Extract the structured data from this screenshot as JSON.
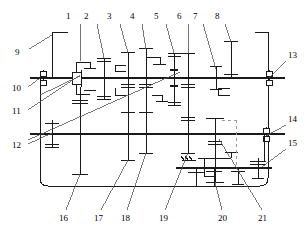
{
  "diagram": {
    "type": "mechanical-kinematic-schematic",
    "background": "#ffffff",
    "line_color": "#1a1a1a",
    "dashed_color": "#9a9a9a"
  },
  "labels": {
    "top": [
      {
        "id": "1",
        "x": 69,
        "y": 17,
        "lx": 80,
        "ly": 24,
        "ex": 80,
        "ey": 61
      },
      {
        "id": "2",
        "x": 87,
        "y": 17,
        "lx": 97,
        "ly": 24,
        "ex": 104,
        "ey": 58
      },
      {
        "id": "3",
        "x": 110,
        "y": 17,
        "lx": 120,
        "ly": 24,
        "ex": 128,
        "ey": 53
      },
      {
        "id": "4",
        "x": 133,
        "y": 17,
        "lx": 142,
        "ly": 24,
        "ex": 146,
        "ey": 49
      },
      {
        "id": "5",
        "x": 157,
        "y": 17,
        "lx": 166,
        "ly": 24,
        "ex": 174,
        "ey": 53
      },
      {
        "id": "6",
        "x": 180,
        "y": 17,
        "lx": 188,
        "ly": 24,
        "ex": 188,
        "ey": 53
      },
      {
        "id": "7",
        "x": 196,
        "y": 17,
        "lx": 203,
        "ly": 24,
        "ex": 216,
        "ey": 69
      },
      {
        "id": "8",
        "x": 218,
        "y": 17,
        "lx": 225,
        "ly": 24,
        "ex": 231,
        "ey": 42
      }
    ],
    "left": [
      {
        "id": "9",
        "x": 18,
        "y": 52,
        "lx": 29,
        "ly": 49,
        "ex": 52,
        "ey": 32
      },
      {
        "id": "10",
        "x": 16,
        "y": 90,
        "lx": 28,
        "ly": 87,
        "ex": 40,
        "ey": 78
      },
      {
        "id": "11",
        "x": 16,
        "y": 113,
        "lx": 28,
        "ly": 110,
        "ex": 76,
        "ey": 75
      },
      {
        "id": "12",
        "x": 16,
        "y": 147,
        "lx": 28,
        "ly": 144,
        "ex": 52,
        "ey": 133
      }
    ],
    "right": [
      {
        "id": "13",
        "x": 288,
        "y": 57,
        "lx": 286,
        "ly": 61,
        "ex": 269,
        "ey": 78
      },
      {
        "id": "14",
        "x": 288,
        "y": 121,
        "lx": 286,
        "ly": 125,
        "ex": 266,
        "ey": 136
      },
      {
        "id": "15",
        "x": 288,
        "y": 145,
        "lx": 286,
        "ly": 149,
        "ex": 262,
        "ey": 167
      }
    ],
    "bottom": [
      {
        "id": "16",
        "x": 62,
        "y": 218,
        "lx": 66,
        "ly": 210,
        "ex": 80,
        "ey": 174
      },
      {
        "id": "17",
        "x": 97,
        "y": 218,
        "lx": 101,
        "ly": 210,
        "ex": 128,
        "ey": 160
      },
      {
        "id": "18",
        "x": 124,
        "y": 218,
        "lx": 127,
        "ly": 210,
        "ex": 146,
        "ey": 153
      },
      {
        "id": "19",
        "x": 162,
        "y": 218,
        "lx": 165,
        "ly": 210,
        "ex": 188,
        "ey": 153
      },
      {
        "id": "20",
        "x": 222,
        "y": 218,
        "lx": 222,
        "ly": 210,
        "ex": 215,
        "ey": 182
      },
      {
        "id": "21",
        "x": 262,
        "y": 218,
        "lx": 262,
        "ly": 210,
        "ex": 219,
        "ey": 139
      }
    ]
  },
  "shafts": {
    "input_shaft": {
      "y": 78,
      "x1": 30,
      "x2": 285,
      "label_ref": "10"
    },
    "counter_shaft": {
      "y": 134,
      "x1": 30,
      "x2": 285,
      "label_ref": "12"
    },
    "output_shaft": {
      "y": 168,
      "x1": 176,
      "x2": 272,
      "label_ref": "15"
    }
  },
  "housing": {
    "x": 40,
    "y": 33,
    "w": 228,
    "h": 153,
    "corner_radius": 8
  },
  "bearings": [
    {
      "name": "bearing-left-upper",
      "x": 43,
      "y": 78
    },
    {
      "name": "bearing-right-upper",
      "x": 269,
      "y": 78
    },
    {
      "name": "bearing-right-lower",
      "x": 266,
      "y": 134
    }
  ],
  "gear_stations": [
    {
      "name": "gear-station-1",
      "x": 80,
      "note": "synchronizer hub + gears"
    },
    {
      "name": "gear-station-2",
      "x": 104,
      "note": "paired gear"
    },
    {
      "name": "gear-station-3",
      "x": 128,
      "note": "tall gear upper+lower"
    },
    {
      "name": "gear-station-4",
      "x": 146,
      "note": "tall gear upper+lower"
    },
    {
      "name": "gear-station-5",
      "x": 174,
      "note": "synchronizer"
    },
    {
      "name": "gear-station-6",
      "x": 188,
      "note": "tall gear upper+lower"
    },
    {
      "name": "gear-station-7",
      "x": 216,
      "note": "planetary / range gear"
    },
    {
      "name": "gear-station-8",
      "x": 231,
      "note": "shift collar"
    }
  ],
  "ground_symbol": {
    "name": "ground-hatch",
    "x": 188,
    "y": 158
  },
  "annotations": {
    "dashed_link": {
      "name": "shift-linkage-dashed",
      "x": 236,
      "y_top": 120,
      "y_bottom": 168
    }
  }
}
